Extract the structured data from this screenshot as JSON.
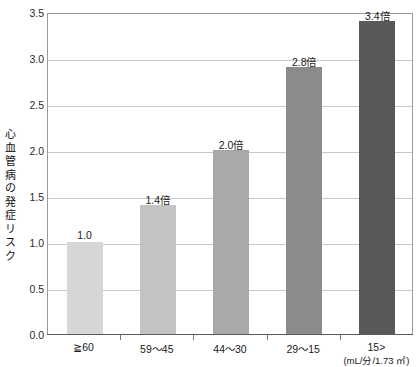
{
  "chart_data": {
    "type": "bar",
    "title": "",
    "xlabel": "",
    "ylabel": "心血管病の発症リスク",
    "x_unit": "(mL/分/1.73 ㎡)",
    "categories": [
      "≧60",
      "59〜45",
      "44〜30",
      "29〜15",
      "15>"
    ],
    "values": [
      1.0,
      1.4,
      2.0,
      2.9,
      3.4
    ],
    "data_labels": [
      "1.0",
      "1.4倍",
      "2.0倍",
      "2.8倍",
      "3.4倍"
    ],
    "ylim": [
      0.0,
      3.5
    ],
    "y_ticks": [
      "0.0",
      "0.5",
      "1.0",
      "1.5",
      "2.0",
      "2.5",
      "3.0",
      "3.5"
    ],
    "y_tick_values": [
      0.0,
      0.5,
      1.0,
      1.5,
      2.0,
      2.5,
      3.0,
      3.5
    ],
    "grid": true,
    "legend": "none",
    "bar_colors": [
      "#d6d6d6",
      "#c3c3c3",
      "#a9a9a9",
      "#8b8b8b",
      "#585858"
    ],
    "colors": {
      "plot_border": "#9a9a9a",
      "gridline": "#c9c9c9",
      "axis_line": "#5a5a5a",
      "text": "#1a1a1a",
      "background": "#ffffff"
    }
  }
}
